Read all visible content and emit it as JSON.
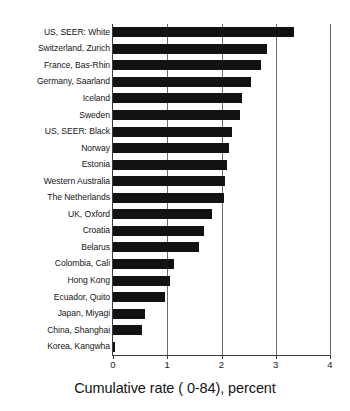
{
  "chart_data": {
    "type": "bar",
    "orientation": "horizontal",
    "title": "",
    "xlabel": "Cumulative rate ( 0-84), percent",
    "ylabel": "",
    "xlim": [
      0,
      4
    ],
    "xticks": [
      "0",
      "1",
      "2",
      "3",
      "4"
    ],
    "grid": true,
    "legend": null,
    "categories": [
      "US, SEER: White",
      "Switzerland, Zurich",
      "France, Bas-Rhin",
      "Germany, Saarland",
      "Iceland",
      "Sweden",
      "US, SEER: Black",
      "Norway",
      "Estonia",
      "Western Australia",
      "The Netherlands",
      "UK, Oxford",
      "Croatia",
      "Belarus",
      "Colombia, Cali",
      "Hong Kong",
      "Ecuador, Quito",
      "Japan, Miyagi",
      "China, Shanghai",
      "Korea, Kangwha"
    ],
    "values": [
      3.33,
      2.83,
      2.72,
      2.54,
      2.37,
      2.35,
      2.19,
      2.13,
      2.11,
      2.07,
      2.04,
      1.83,
      1.67,
      1.59,
      1.13,
      1.05,
      0.96,
      0.59,
      0.54,
      0.03
    ],
    "bar_color": "#121212"
  }
}
